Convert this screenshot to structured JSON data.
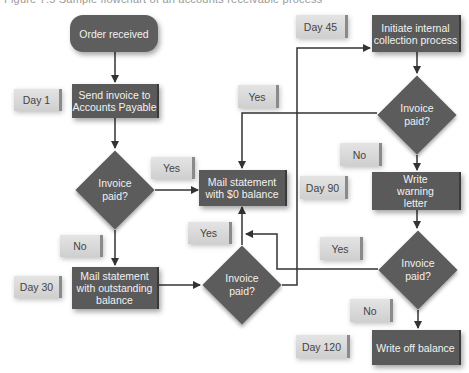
{
  "figure": {
    "title": "Figure 7.5  Sample flowchart of an accounts receivable process"
  },
  "nodes": {
    "start": {
      "label": "Order received"
    },
    "send_invoice": {
      "label": "Send invoice to Accounts Payable"
    },
    "decision_1": {
      "label": "Invoice paid?"
    },
    "mail_zero": {
      "label": "Mail statement with $0 balance"
    },
    "mail_outstanding": {
      "label": "Mail statement with outstanding balance"
    },
    "decision_2": {
      "label": "Invoice paid?"
    },
    "initiate_collection": {
      "label": "Initiate internal collection process"
    },
    "decision_3": {
      "label": "Invoice paid?"
    },
    "warning_letter": {
      "label": "Write warning letter"
    },
    "decision_4": {
      "label": "Invoice paid?"
    },
    "write_off": {
      "label": "Write off balance"
    }
  },
  "tags": {
    "day_1": "Day 1",
    "day_30": "Day 30",
    "day_45": "Day 45",
    "day_90": "Day 90",
    "day_120": "Day 120",
    "yes_1": "Yes",
    "no_1": "No",
    "yes_2": "Yes",
    "yes_3": "Yes",
    "no_3": "No",
    "yes_4": "Yes",
    "no_4": "No"
  },
  "colors": {
    "node_fill": "#5a5a5a",
    "tag_fill": "#d8d8d8",
    "line": "#333333"
  }
}
